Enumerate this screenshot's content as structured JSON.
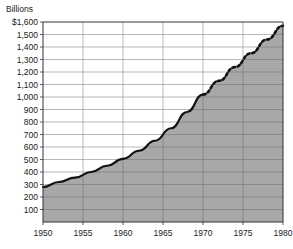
{
  "chart_data": {
    "type": "area",
    "title": "Billions",
    "xlabel": "",
    "ylabel": "Billions",
    "xlim": [
      1950,
      1980
    ],
    "ylim": [
      0,
      1600
    ],
    "grid": true,
    "legend_position": "none",
    "y_ticks": [
      {
        "value": 1600,
        "label": "$1,600"
      },
      {
        "value": 1500,
        "label": "1,500"
      },
      {
        "value": 1400,
        "label": "1,400"
      },
      {
        "value": 1300,
        "label": "1,300"
      },
      {
        "value": 1200,
        "label": "1,200"
      },
      {
        "value": 1100,
        "label": "1,100"
      },
      {
        "value": 1000,
        "label": "1,000"
      },
      {
        "value": 900,
        "label": "900"
      },
      {
        "value": 800,
        "label": "800"
      },
      {
        "value": 700,
        "label": "700"
      },
      {
        "value": 600,
        "label": "600"
      },
      {
        "value": 500,
        "label": "500"
      },
      {
        "value": 400,
        "label": "400"
      },
      {
        "value": 300,
        "label": "300"
      },
      {
        "value": 200,
        "label": "200"
      },
      {
        "value": 100,
        "label": "100"
      }
    ],
    "x_ticks": [
      {
        "value": 1950,
        "label": "1950"
      },
      {
        "value": 1955,
        "label": "1955"
      },
      {
        "value": 1960,
        "label": "1960"
      },
      {
        "value": 1965,
        "label": "1965"
      },
      {
        "value": 1970,
        "label": "1970"
      },
      {
        "value": 1975,
        "label": "1975"
      },
      {
        "value": 1980,
        "label": "1980"
      }
    ],
    "series": [
      {
        "name": "Actual",
        "style": "solid",
        "x": [
          1950,
          1952,
          1954,
          1956,
          1958,
          1960,
          1962,
          1964,
          1966,
          1968,
          1970
        ],
        "values": [
          280,
          320,
          355,
          400,
          450,
          505,
          570,
          650,
          750,
          880,
          1020
        ]
      },
      {
        "name": "Projected",
        "style": "dashed",
        "x": [
          1970,
          1972,
          1974,
          1976,
          1978,
          1980
        ],
        "values": [
          1020,
          1130,
          1240,
          1350,
          1460,
          1570
        ]
      }
    ],
    "area_fill_color": "#a8a8a8",
    "line_color": "#111111",
    "grid_color": "#9a9a9a",
    "axis_color": "#333333",
    "background_color": "#ffffff"
  }
}
